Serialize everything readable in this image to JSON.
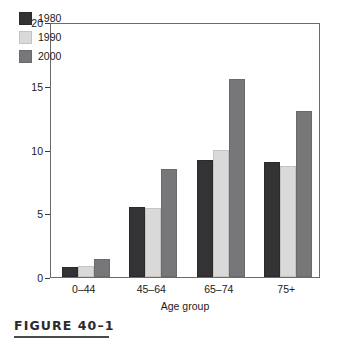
{
  "figure": {
    "caption": "FIGURE 40–1"
  },
  "chart_data": {
    "type": "bar",
    "title": "",
    "xlabel": "Age group",
    "ylabel": "Diabetes prevalence/100 population",
    "categories": [
      "0–44",
      "45–64",
      "65–74",
      "75+"
    ],
    "series": [
      {
        "name": "1980",
        "color": "#333336",
        "values": [
          0.8,
          5.5,
          9.2,
          9.0
        ]
      },
      {
        "name": "1990",
        "color": "#d9d9d9",
        "values": [
          0.9,
          5.4,
          10.0,
          8.7
        ]
      },
      {
        "name": "2000",
        "color": "#777779",
        "values": [
          1.4,
          8.5,
          15.5,
          13.0
        ]
      }
    ],
    "ylim": [
      0,
      20
    ],
    "yticks": [
      0,
      5,
      10,
      15,
      20
    ],
    "ytick_labels": [
      "0",
      "5",
      "10",
      "15",
      "20"
    ],
    "grid": false,
    "legend_position": "top-left",
    "legend_entries": [
      "1980",
      "1990",
      "2000"
    ]
  }
}
